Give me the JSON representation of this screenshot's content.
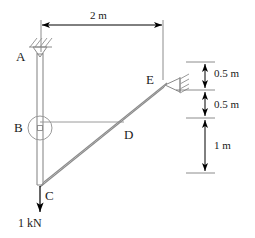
{
  "diagram": {
    "type": "structural-free-body-diagram",
    "colors": {
      "member": "#8a8a8a",
      "dimension": "#000000",
      "text": "#1a1a1a",
      "support_hatch": "#9a9a9a",
      "background": "#ffffff"
    },
    "nodes": [
      {
        "id": "A",
        "label": "A",
        "support": "pin-hatched",
        "x": 40,
        "y": 57
      },
      {
        "id": "B",
        "label": "B",
        "support": "pin-circle",
        "x": 40,
        "y": 128
      },
      {
        "id": "C",
        "label": "C",
        "support": "free",
        "x": 40,
        "y": 184
      },
      {
        "id": "D",
        "label": "D",
        "support": "none",
        "x": 122,
        "y": 134
      },
      {
        "id": "E",
        "label": "E",
        "support": "pin-hatched",
        "x": 163,
        "y": 85
      }
    ],
    "members": [
      {
        "from": "A",
        "to": "C",
        "style": "double-line-column"
      },
      {
        "from": "C",
        "to": "E",
        "style": "double-line-beam"
      },
      {
        "from": "B",
        "to": "D",
        "style": "single-line-tie"
      }
    ],
    "dimensions": [
      {
        "id": "span-top",
        "label": "2 m",
        "orientation": "horizontal",
        "from": "A",
        "to": "E"
      },
      {
        "id": "e-upper",
        "label": "0.5 m",
        "orientation": "vertical"
      },
      {
        "id": "e-lower",
        "label": "0.5 m",
        "orientation": "vertical"
      },
      {
        "id": "d-to-c",
        "label": "1 m",
        "orientation": "vertical"
      }
    ],
    "loads": [
      {
        "id": "load-c",
        "label": "1 kN",
        "magnitude": 1,
        "unit": "kN",
        "direction": "down",
        "at": "C"
      }
    ]
  },
  "labels": {
    "node_a": "A",
    "node_b": "B",
    "node_c": "C",
    "node_d": "D",
    "node_e": "E",
    "dim_span": "2 m",
    "dim_half_upper": "0.5 m",
    "dim_half_lower": "0.5 m",
    "dim_one": "1 m",
    "load_value": "1 kN"
  }
}
